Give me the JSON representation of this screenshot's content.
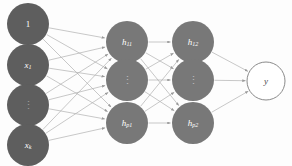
{
  "diagram": {
    "background_color": "#fdfdfd",
    "edge_color": "#b0b0b0",
    "input_node_color": "#5e5e5e",
    "hidden_node_color": "#787878",
    "output_node_color": "#ffffff",
    "output_node_stroke": "#8a8a8a",
    "label_color": "#ffffff",
    "output_label_color": "#4a4a4a",
    "node_radius": 21,
    "output_node_radius": 19
  },
  "layers": [
    {
      "id": "input-layer",
      "name": "input-layer",
      "x": 28,
      "nodes": [
        {
          "id": "input-bias",
          "label": "1",
          "kind": "plain",
          "cx": 28,
          "cy": 24,
          "r": 21
        },
        {
          "id": "input-x1",
          "label": "x",
          "sub": "1",
          "kind": "italic",
          "cx": 28,
          "cy": 65,
          "r": 21
        },
        {
          "id": "input-dots",
          "label": "⋮",
          "kind": "dots",
          "cx": 28,
          "cy": 105,
          "r": 21
        },
        {
          "id": "input-xk",
          "label": "x",
          "sub": "k",
          "kind": "italic",
          "cx": 28,
          "cy": 145,
          "r": 21
        }
      ]
    },
    {
      "id": "hidden-layer-1",
      "name": "hidden-layer-1",
      "x": 127,
      "nodes": [
        {
          "id": "hidden1-h11",
          "label": "h",
          "sub": "11",
          "kind": "italic",
          "cx": 127,
          "cy": 42,
          "r": 21
        },
        {
          "id": "hidden1-dots",
          "label": "⋮",
          "kind": "dots",
          "cx": 127,
          "cy": 80,
          "r": 21
        },
        {
          "id": "hidden1-hp1",
          "label": "h",
          "sub": "p1",
          "kind": "italic",
          "cx": 127,
          "cy": 123,
          "r": 21
        }
      ]
    },
    {
      "id": "hidden-layer-2",
      "name": "hidden-layer-2",
      "x": 193,
      "nodes": [
        {
          "id": "hidden2-h12",
          "label": "h",
          "sub": "12",
          "kind": "italic",
          "cx": 193,
          "cy": 42,
          "r": 21
        },
        {
          "id": "hidden2-dots",
          "label": "⋮",
          "kind": "dots",
          "cx": 193,
          "cy": 80,
          "r": 21
        },
        {
          "id": "hidden2-hp2",
          "label": "h",
          "sub": "p2",
          "kind": "italic",
          "cx": 193,
          "cy": 123,
          "r": 21
        }
      ]
    },
    {
      "id": "output-layer",
      "name": "output-layer",
      "x": 266,
      "nodes": [
        {
          "id": "output-y",
          "label": "y",
          "kind": "output",
          "cx": 266,
          "cy": 81,
          "r": 19
        }
      ]
    }
  ],
  "connections": [
    {
      "from": "input-bias",
      "to": "hidden1-h11"
    },
    {
      "from": "input-bias",
      "to": "hidden1-dots"
    },
    {
      "from": "input-bias",
      "to": "hidden1-hp1"
    },
    {
      "from": "input-x1",
      "to": "hidden1-h11"
    },
    {
      "from": "input-x1",
      "to": "hidden1-dots"
    },
    {
      "from": "input-x1",
      "to": "hidden1-hp1"
    },
    {
      "from": "input-dots",
      "to": "hidden1-h11"
    },
    {
      "from": "input-dots",
      "to": "hidden1-dots"
    },
    {
      "from": "input-dots",
      "to": "hidden1-hp1"
    },
    {
      "from": "input-xk",
      "to": "hidden1-h11"
    },
    {
      "from": "input-xk",
      "to": "hidden1-dots"
    },
    {
      "from": "input-xk",
      "to": "hidden1-hp1"
    },
    {
      "from": "hidden1-h11",
      "to": "hidden2-h12"
    },
    {
      "from": "hidden1-h11",
      "to": "hidden2-dots"
    },
    {
      "from": "hidden1-h11",
      "to": "hidden2-hp2"
    },
    {
      "from": "hidden1-dots",
      "to": "hidden2-h12"
    },
    {
      "from": "hidden1-dots",
      "to": "hidden2-dots"
    },
    {
      "from": "hidden1-dots",
      "to": "hidden2-hp2"
    },
    {
      "from": "hidden1-hp1",
      "to": "hidden2-h12"
    },
    {
      "from": "hidden1-hp1",
      "to": "hidden2-dots"
    },
    {
      "from": "hidden1-hp1",
      "to": "hidden2-hp2"
    },
    {
      "from": "hidden2-h12",
      "to": "output-y"
    },
    {
      "from": "hidden2-dots",
      "to": "output-y"
    },
    {
      "from": "hidden2-hp2",
      "to": "output-y"
    }
  ]
}
